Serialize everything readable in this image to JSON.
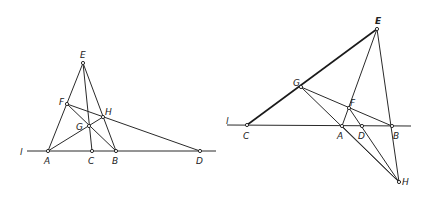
{
  "figures": [
    {
      "id": "left",
      "line_label": "l",
      "points": {
        "E": {
          "x": 83,
          "y": 63,
          "label": "E"
        },
        "F": {
          "x": 67,
          "y": 104,
          "label": "F"
        },
        "H": {
          "x": 103,
          "y": 117,
          "label": "H"
        },
        "G": {
          "x": 89,
          "y": 126,
          "label": "G"
        },
        "A": {
          "x": 48,
          "y": 151,
          "label": "A"
        },
        "C": {
          "x": 92,
          "y": 151,
          "label": "C"
        },
        "B": {
          "x": 116,
          "y": 151,
          "label": "B"
        },
        "D": {
          "x": 200,
          "y": 151,
          "label": "D"
        }
      },
      "segments": [
        [
          "A",
          "E"
        ],
        [
          "E",
          "B"
        ],
        [
          "E",
          "C"
        ],
        [
          "A",
          "H"
        ],
        [
          "F",
          "B"
        ],
        [
          "F",
          "D"
        ],
        [
          "l_start",
          "l_end"
        ]
      ]
    },
    {
      "id": "right",
      "line_label": "l",
      "points": {
        "E": {
          "x": 377,
          "y": 29,
          "label": "E"
        },
        "G": {
          "x": 301,
          "y": 87,
          "label": "G"
        },
        "F": {
          "x": 349,
          "y": 108,
          "label": "F"
        },
        "C": {
          "x": 247,
          "y": 125,
          "label": "C"
        },
        "A": {
          "x": 342,
          "y": 126,
          "label": "A"
        },
        "D": {
          "x": 362,
          "y": 126,
          "label": "D"
        },
        "B": {
          "x": 392,
          "y": 126,
          "label": "B"
        },
        "H": {
          "x": 399,
          "y": 182,
          "label": "H"
        }
      },
      "segments": [
        [
          "C",
          "E"
        ],
        [
          "E",
          "A"
        ],
        [
          "E",
          "H"
        ],
        [
          "G",
          "B"
        ],
        [
          "G",
          "H"
        ],
        [
          "A",
          "H"
        ],
        [
          "F",
          "H"
        ],
        [
          "l_start",
          "l_end"
        ]
      ]
    }
  ]
}
